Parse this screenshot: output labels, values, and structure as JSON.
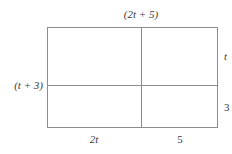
{
  "figure": {
    "type": "area-model-rectangle",
    "background_color": "#ffffff",
    "line_color": "#8c8c8c",
    "text_color": "#3a3a3a",
    "labels": {
      "top": "(2t + 5)",
      "left": "(t + 3)",
      "right_upper": "t",
      "right_lower": "3",
      "bottom_left": "2t",
      "bottom_right": "5"
    }
  }
}
